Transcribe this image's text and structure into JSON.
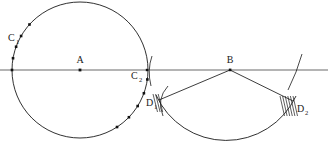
{
  "figure": {
    "background_color": "#ffffff",
    "stroke_color": "#1a1a1a",
    "baseline_color": "#555555",
    "width": 328,
    "height": 151
  },
  "labels": {
    "c1": {
      "base": "C",
      "sub": "1",
      "x": 8,
      "y": 41
    },
    "a": {
      "base": "A",
      "sub": "",
      "x": 80,
      "y": 63
    },
    "c2": {
      "base": "C",
      "sub": "2",
      "x": 131,
      "y": 79
    },
    "d1": {
      "base": "D",
      "sub": "1",
      "x": 146,
      "y": 106
    },
    "b": {
      "base": "B",
      "sub": "",
      "x": 227,
      "y": 63
    },
    "d2": {
      "base": "D",
      "sub": "2",
      "x": 297,
      "y": 112
    }
  },
  "points": {
    "center_a": {
      "x": 80,
      "y": 70,
      "label": "A"
    },
    "vertex_b": {
      "x": 230,
      "y": 70,
      "label": "B"
    },
    "point_c2": {
      "x": 147,
      "y": 70,
      "label": "C2"
    },
    "point_d1": {
      "x": 161,
      "y": 99,
      "label": "D1"
    },
    "point_d2": {
      "x": 291,
      "y": 100,
      "label": "D2"
    }
  },
  "circle": {
    "cx": 80,
    "cy": 70,
    "r": 68,
    "label": "main-circle-centered-at-A"
  },
  "baseline": {
    "x1": 0,
    "y1": 70,
    "x2": 328,
    "y2": 70,
    "label": "horizontal-reference-line"
  },
  "sector": {
    "apex": {
      "x": 230,
      "y": 70
    },
    "radius": 77,
    "left_arm_end": {
      "x": 161,
      "y": 99
    },
    "right_arm_end": {
      "x": 291,
      "y": 100
    },
    "arc_label": "sector-arc-D1-to-D2"
  },
  "tick_arcs": [
    {
      "name": "tick-arc-left",
      "cx": 148,
      "cy": 70,
      "note": "short arc crossing baseline near C2"
    },
    {
      "name": "tick-arc-right",
      "cx": 300,
      "cy": 70,
      "note": "short arc crossing baseline near D2"
    }
  ],
  "circle_dots": {
    "upper_left_arc": [
      {
        "angle_deg": 180
      },
      {
        "angle_deg": 170
      },
      {
        "angle_deg": 160
      },
      {
        "angle_deg": 150
      },
      {
        "angle_deg": 138
      }
    ],
    "lower_right_arc": [
      {
        "angle_deg": 352
      },
      {
        "angle_deg": 340
      },
      {
        "angle_deg": 328
      },
      {
        "angle_deg": 316
      },
      {
        "angle_deg": 303
      }
    ]
  },
  "hatching": {
    "d1_marks": 3,
    "d2_marks": 6,
    "note": "short parallel tick strokes indicating congruent intersections"
  }
}
